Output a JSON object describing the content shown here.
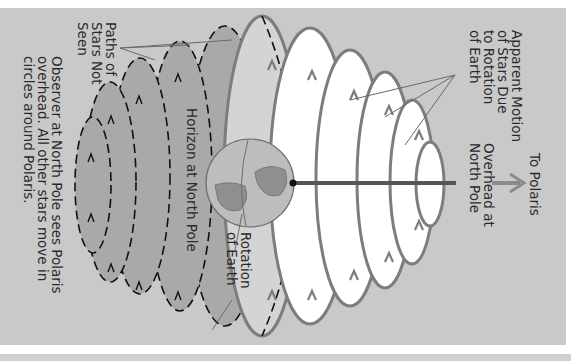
{
  "diagram": {
    "orientation": "rotated 90 degrees clockwise",
    "labels": {
      "apparent_motion": [
        "Apparent Motion",
        "of Stars Due",
        "to Rotation",
        "of Earth"
      ],
      "to_polaris": "To Polaris",
      "overhead": [
        "Overhead at",
        "North Pole"
      ],
      "paths_not_seen": [
        "Paths of",
        "Stars Not",
        "Seen"
      ],
      "horizon": "Horizon at North Pole",
      "rotation_of_earth": [
        "Rotation",
        "of Earth"
      ],
      "caption": [
        "Observer at North Pole sees Polaris",
        "overhead. All other stars move in",
        "circles around Polaris."
      ]
    },
    "colors": {
      "panel": "#c9c9c9",
      "visible_path_stroke": "#7d7d7d",
      "visible_path_fill": "#ffffff",
      "hidden_path_stroke": "#111111",
      "hidden_region_fill": "#a9a9a9",
      "horizon_band_fill": "#d4d4d4",
      "axis": "#555555",
      "arrow": "#8a8a8a"
    }
  }
}
